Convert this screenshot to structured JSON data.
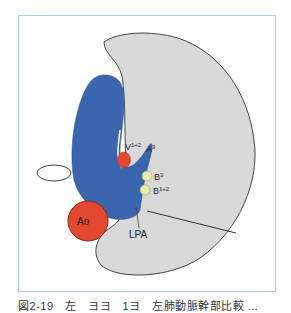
{
  "figure": {
    "labels": {
      "v12": {
        "base": "V",
        "sup": "1+2"
      },
      "a3": {
        "base": "A",
        "sup": "3"
      },
      "b3": {
        "base": "B",
        "sup": "3"
      },
      "b12": {
        "base": "B",
        "sup": "1+2"
      },
      "ao": "Ao",
      "lpa": "LPA"
    },
    "colors": {
      "lung": "#d9d9d9",
      "pulmonary_artery": "#3a66b0",
      "vein_aorta": "#e2472f",
      "bronchus": "#e8efaa",
      "frame": "#a9d2ea"
    }
  },
  "caption": "図2-19　左　ヨヨ　1ヨ　左肺動脈幹部比較 ..."
}
